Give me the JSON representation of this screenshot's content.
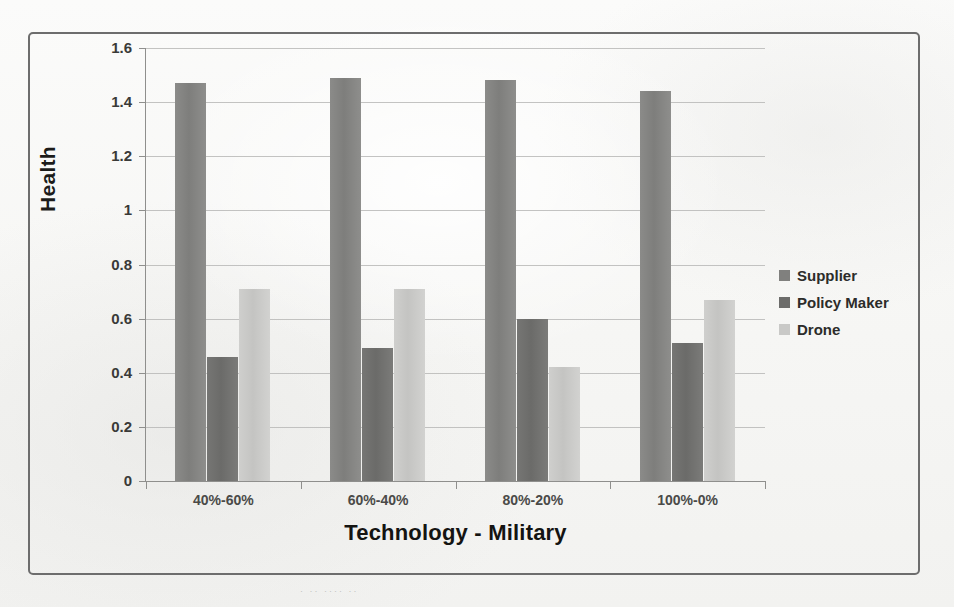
{
  "chart_data": {
    "type": "bar",
    "title": "",
    "subtitle": "",
    "xlabel": "Technology - Military",
    "ylabel": "Health",
    "categories": [
      "40%-60%",
      "60%-40%",
      "80%-20%",
      "100%-0%"
    ],
    "series": [
      {
        "name": "Supplier",
        "color": "#80807e",
        "values": [
          1.47,
          1.49,
          1.48,
          1.44
        ]
      },
      {
        "name": "Policy Maker",
        "color": "#6c6c6a",
        "values": [
          0.46,
          0.49,
          0.6,
          0.51
        ]
      },
      {
        "name": "Drone",
        "color": "#c9c9c7",
        "values": [
          0.71,
          0.71,
          0.42,
          0.67
        ]
      }
    ],
    "ylim": [
      0,
      1.6
    ],
    "yticks": [
      0,
      0.2,
      0.4,
      0.6,
      0.8,
      1,
      1.2,
      1.4,
      1.6
    ],
    "ytick_labels": [
      "0",
      "0.2",
      "0.4",
      "0.6",
      "0.8",
      "1",
      "1.2",
      "1.4",
      "1.6"
    ],
    "grid": true,
    "legend_position": "right",
    "legend_entries": [
      "Supplier",
      "Policy Maker",
      "Drone"
    ]
  },
  "figure": {
    "border_color": "#6d6d6d",
    "background": "#fdfdfc",
    "gridline_color": "#b9b9b7",
    "axis_color": "#8f8f8d"
  }
}
